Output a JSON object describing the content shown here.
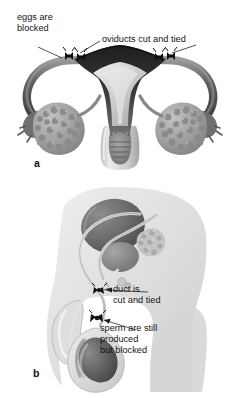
{
  "figure": {
    "background_color": "#ffffff",
    "panels": [
      {
        "id": "panel-a",
        "letter": "a",
        "subject": "female-sterilization-tubal-ligation",
        "labels": [
          {
            "name": "eggs-are-blocked",
            "lines": [
              "eggs are",
              "blocked"
            ],
            "x": 17,
            "y": 20
          },
          {
            "name": "oviducts-cut-and-tied",
            "lines": [
              "oviducts cut and tied"
            ],
            "x": 102,
            "y": 42
          }
        ],
        "anatomy": [
          {
            "name": "uterus",
            "color": "#2a2a2a"
          },
          {
            "name": "uterine-cavity",
            "color": "#c9c9c9"
          },
          {
            "name": "cervix",
            "color": "#8e8e8e"
          },
          {
            "name": "vagina",
            "color": "#cfcfcf"
          },
          {
            "name": "oviduct-left",
            "color": "#6a6a6a"
          },
          {
            "name": "oviduct-right",
            "color": "#6a6a6a"
          },
          {
            "name": "ovary-left",
            "color": "#9a9a9a"
          },
          {
            "name": "ovary-right",
            "color": "#9a9a9a"
          },
          {
            "name": "fimbriae-left",
            "color": "#7d7d7d"
          },
          {
            "name": "fimbriae-right",
            "color": "#7d7d7d"
          },
          {
            "name": "ligature-knot",
            "color": "#111111"
          }
        ]
      },
      {
        "id": "panel-b",
        "letter": "b",
        "subject": "male-sterilization-vasectomy",
        "labels": [
          {
            "name": "duct-is-cut-and-tied",
            "lines": [
              "duct is",
              "cut and tied"
            ],
            "x": 113,
            "y": 290
          },
          {
            "name": "sperm-are-still-produced-but-blocked",
            "lines": [
              "sperm are still",
              "produced",
              "but blocked"
            ],
            "x": 100,
            "y": 327
          }
        ],
        "anatomy": [
          {
            "name": "body-silhouette",
            "color": "#e2e2e2"
          },
          {
            "name": "bladder",
            "color": "#6d6d6d"
          },
          {
            "name": "prostate",
            "color": "#8b8b8b"
          },
          {
            "name": "seminal-vesicle",
            "color": "#bdbdbd"
          },
          {
            "name": "vas-deferens-left",
            "color": "#cacaca"
          },
          {
            "name": "vas-deferens-right",
            "color": "#cacaca"
          },
          {
            "name": "urethra",
            "color": "#d2d2d2"
          },
          {
            "name": "penis",
            "color": "#dcdcdc"
          },
          {
            "name": "scrotum",
            "color": "#d4d4d4"
          },
          {
            "name": "testis",
            "color": "#5f5f5f"
          },
          {
            "name": "epididymis",
            "color": "#9d9d9d"
          },
          {
            "name": "ligature-knot",
            "color": "#111111"
          }
        ]
      }
    ]
  }
}
